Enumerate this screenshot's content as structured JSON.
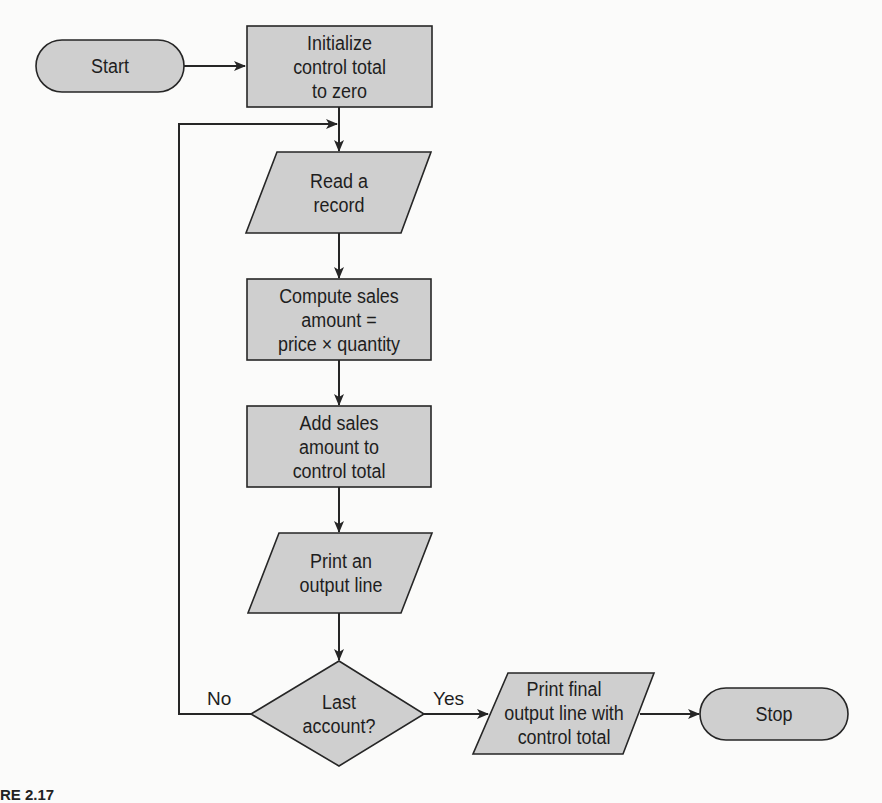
{
  "diagram": {
    "type": "flowchart",
    "colors": {
      "shape_fill": "#cfcfcf",
      "stroke": "#262626",
      "background": "#fbfbfa"
    },
    "nodes": [
      {
        "id": "start",
        "shape": "terminal",
        "label": "Start"
      },
      {
        "id": "init",
        "shape": "process",
        "label": "Initialize\ncontrol total\nto zero"
      },
      {
        "id": "read",
        "shape": "input-output",
        "label": "Read a\nrecord"
      },
      {
        "id": "compute",
        "shape": "process",
        "label": "Compute sales\namount =\nprice × quantity"
      },
      {
        "id": "add",
        "shape": "process",
        "label": "Add sales\namount to\ncontrol total"
      },
      {
        "id": "print",
        "shape": "input-output",
        "label": "Print an\noutput line"
      },
      {
        "id": "decision",
        "shape": "decision",
        "label": "Last\naccount?"
      },
      {
        "id": "print_final",
        "shape": "input-output",
        "label": "Print final\noutput line with\ncontrol total"
      },
      {
        "id": "stop",
        "shape": "terminal",
        "label": "Stop"
      }
    ],
    "edges": [
      {
        "from": "start",
        "to": "init"
      },
      {
        "from": "init",
        "to": "read"
      },
      {
        "from": "read",
        "to": "compute"
      },
      {
        "from": "compute",
        "to": "add"
      },
      {
        "from": "add",
        "to": "print"
      },
      {
        "from": "print",
        "to": "decision"
      },
      {
        "from": "decision",
        "to": "read",
        "label": "No"
      },
      {
        "from": "decision",
        "to": "print_final",
        "label": "Yes"
      },
      {
        "from": "print_final",
        "to": "stop"
      }
    ],
    "edge_labels": {
      "no": "No",
      "yes": "Yes"
    },
    "caption_fragment": "RE 2.17"
  }
}
